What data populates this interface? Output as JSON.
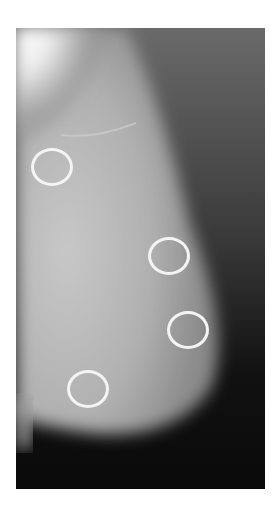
{
  "image": {
    "description": "Mammogram (mediolateral view) with four circled regions of interest",
    "background_color": "#ffffff",
    "circle_color": "#f4f4f4",
    "annotations": [
      {
        "label": "roi-1",
        "cx": 52,
        "cy": 167,
        "r": 20
      },
      {
        "label": "roi-2",
        "cx": 169,
        "cy": 256,
        "r": 20
      },
      {
        "label": "roi-3",
        "cx": 188,
        "cy": 330,
        "r": 20
      },
      {
        "label": "roi-4",
        "cx": 87,
        "cy": 389,
        "r": 20
      }
    ]
  }
}
